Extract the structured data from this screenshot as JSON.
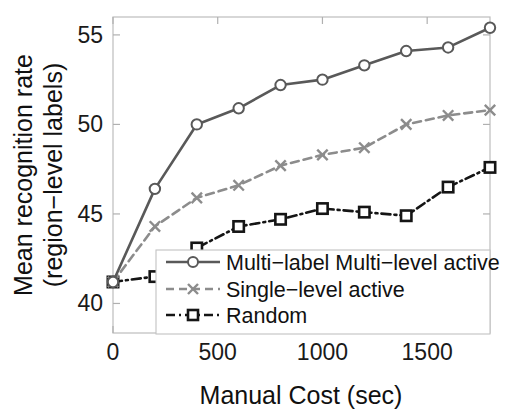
{
  "figure": {
    "background_color": "#ffffff",
    "axis_color": "#b9b9b9",
    "text_color": "#1a1a1a"
  },
  "axes": {
    "x_title": "Manual Cost (sec)",
    "y_title_line1": "Mean recognition rate",
    "y_title_line2": "(region−level labels)",
    "x_tick_labels": [
      "0",
      "500",
      "1000",
      "1500"
    ],
    "y_tick_labels": [
      "40",
      "45",
      "50",
      "55"
    ]
  },
  "legend": {
    "items": [
      {
        "label": "Multi−label Multi−level active",
        "marker": "circle-marker",
        "line": "solid",
        "color": "#595959"
      },
      {
        "label": "Single−level active",
        "marker": "x-marker",
        "line": "dashed",
        "color": "#8c8c8c"
      },
      {
        "label": "Random",
        "marker": "square-marker",
        "line": "dashdot",
        "color": "#151515"
      }
    ]
  },
  "chart_data": {
    "type": "line",
    "title": "",
    "xlabel": "Manual Cost (sec)",
    "ylabel": "Mean recognition rate (region−level labels)",
    "xlim": [
      0,
      1800
    ],
    "ylim": [
      38.35,
      56.0
    ],
    "xticks": [
      0,
      500,
      1000,
      1500
    ],
    "yticks": [
      40,
      45,
      50,
      55
    ],
    "grid": false,
    "legend_position": "lower-center-inside",
    "x": [
      0,
      200,
      400,
      600,
      800,
      1000,
      1200,
      1400,
      1600,
      1800
    ],
    "series": [
      {
        "name": "Multi−label Multi−level active",
        "color": "#595959",
        "linestyle": "solid",
        "marker": "circle-marker",
        "values": [
          41.2,
          46.4,
          50.0,
          50.9,
          52.2,
          52.5,
          53.3,
          54.1,
          54.3,
          55.4
        ]
      },
      {
        "name": "Single−level active",
        "color": "#8c8c8c",
        "linestyle": "dashed",
        "marker": "x-marker",
        "values": [
          41.2,
          44.3,
          45.9,
          46.6,
          47.7,
          48.3,
          48.7,
          50.0,
          50.5,
          50.8
        ]
      },
      {
        "name": "Random",
        "color": "#151515",
        "linestyle": "dashdot",
        "marker": "square-marker",
        "values": [
          41.2,
          41.5,
          43.1,
          44.3,
          44.7,
          45.3,
          45.1,
          44.9,
          46.5,
          47.6
        ]
      }
    ]
  }
}
